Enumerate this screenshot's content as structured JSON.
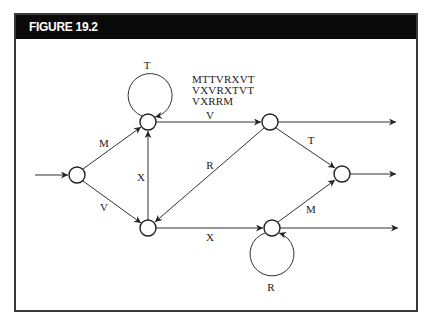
{
  "figure": {
    "title": "FIGURE 19.2"
  },
  "diagram": {
    "sequences": [
      "MTTVRXVT",
      "VXVRXTVT",
      "VXRRM"
    ],
    "nodes": [
      {
        "id": "start",
        "x": 77,
        "y": 175
      },
      {
        "id": "top-left",
        "x": 148,
        "y": 122
      },
      {
        "id": "bottom-left",
        "x": 148,
        "y": 228
      },
      {
        "id": "top-right",
        "x": 270,
        "y": 122
      },
      {
        "id": "bottom-right",
        "x": 272,
        "y": 228
      },
      {
        "id": "right",
        "x": 342,
        "y": 174
      }
    ],
    "edge_labels": {
      "loop_top": "T",
      "start_to_top": "M",
      "start_to_bottom": "V",
      "bottom_to_top": "X",
      "top_left_to_top_right": "V",
      "top_right_to_bottom_left": "R",
      "bottom_left_to_bottom_right": "X",
      "top_right_to_right": "T",
      "bottom_right_to_right": "M",
      "loop_bottom": "R"
    },
    "colors": {
      "stroke": "#333333",
      "header_bg": "#0a0a0a",
      "header_text": "#ffffff"
    }
  }
}
